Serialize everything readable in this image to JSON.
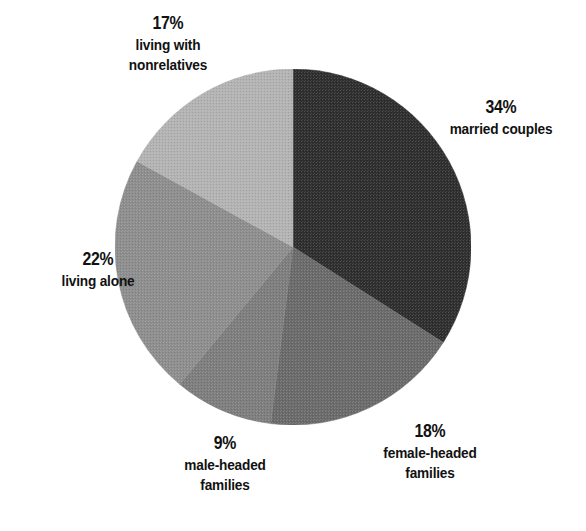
{
  "chart_data": {
    "type": "pie",
    "title": "",
    "subtitle": "",
    "xlabel": "",
    "ylabel": "",
    "legend_position": "none",
    "grid": false,
    "units": "percent",
    "total": 100,
    "start_angle_deg": 0,
    "direction": "clockwise",
    "categories": [
      "married couples",
      "female-headed families",
      "male-headed families",
      "living alone",
      "living with nonrelatives"
    ],
    "values": [
      34,
      18,
      9,
      22,
      17
    ],
    "slices": [
      {
        "label": "married couples",
        "percent_text": "34%",
        "value": 34,
        "color": "#2f2f2f",
        "start_angle_deg": 0,
        "end_angle_deg": 122.4,
        "label_position": "right"
      },
      {
        "label": "female-headed families",
        "percent_text": "18%",
        "value": 18,
        "color": "#6b6b6b",
        "start_angle_deg": 122.4,
        "end_angle_deg": 187.2,
        "label_position": "bottom-right"
      },
      {
        "label": "male-headed families",
        "percent_text": "9%",
        "value": 9,
        "color": "#7e7e7e",
        "start_angle_deg": 187.2,
        "end_angle_deg": 219.6,
        "label_position": "bottom-left"
      },
      {
        "label": "living alone",
        "percent_text": "22%",
        "value": 22,
        "color": "#8e8e8e",
        "start_angle_deg": 219.6,
        "end_angle_deg": 298.8,
        "label_position": "left"
      },
      {
        "label": "living with nonrelatives",
        "percent_text": "17%",
        "value": 17,
        "color": "#b3b3b3",
        "start_angle_deg": 298.8,
        "end_angle_deg": 360,
        "label_position": "top-left"
      }
    ]
  },
  "labels": {
    "nonrelatives": {
      "pct": "17%",
      "line1": "living with",
      "line2": "nonrelatives"
    },
    "married": {
      "pct": "34%",
      "line1": "married couples",
      "line2": ""
    },
    "alone": {
      "pct": "22%",
      "line1": "living alone",
      "line2": ""
    },
    "male": {
      "pct": "9%",
      "line1": "male-headed",
      "line2": "families"
    },
    "female": {
      "pct": "18%",
      "line1": "female-headed",
      "line2": "families"
    }
  },
  "colors": {
    "background": "#ffffff",
    "text": "#111111",
    "slice_married": "#2f2f2f",
    "slice_female": "#6b6b6b",
    "slice_male": "#7e7e7e",
    "slice_alone": "#8e8e8e",
    "slice_nonrelatives": "#b3b3b3"
  }
}
